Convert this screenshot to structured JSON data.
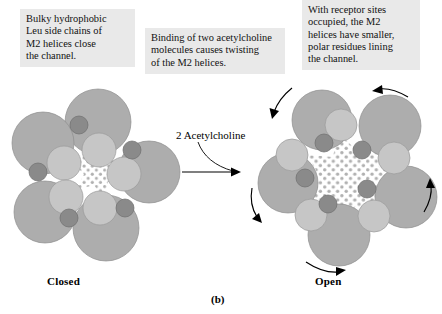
{
  "figure": {
    "panel_label": "(b)",
    "transition_label": "2 Acetylcholine"
  },
  "callouts": [
    {
      "id": "left",
      "text": "Bulky hydrophobic\nLeu side chains of\nM2 helices close\nthe channel."
    },
    {
      "id": "middle",
      "text": "Binding of two acetylcholine\nmolecules causes twisting\nof the M2 helices."
    },
    {
      "id": "right",
      "text": "With receptor sites\noccupied, the M2\nhelices have smaller,\npolar residues lining\nthe channel."
    }
  ],
  "states": [
    {
      "id": "closed",
      "label": "Closed",
      "subunit_count": 5,
      "helix_count": 5,
      "residue_count": 5,
      "pore": "narrow",
      "rotation_arrows": 0
    },
    {
      "id": "open",
      "label": "Open",
      "subunit_count": 5,
      "helix_count": 5,
      "residue_count": 5,
      "pore": "wide-star",
      "rotation_arrows": 4
    }
  ],
  "colors": {
    "subunit": "#adadad",
    "helix": "#c6c6c6",
    "residue": "#8a8a8a",
    "pore_dot": "#b0b0b0",
    "callout_bg": "#e9e9e9",
    "background": "#ffffff",
    "ink": "#000000"
  },
  "icons": {
    "transition_arrow": "right-arrow-icon",
    "rotation_arrow": "curved-rotation-arrow-icon",
    "leader": "leader-line-icon"
  }
}
